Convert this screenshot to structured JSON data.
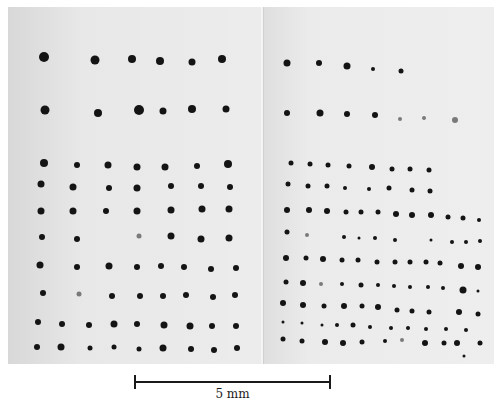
{
  "figure": {
    "scale_bar": {
      "label": "5 mm",
      "length_mm": 5
    },
    "panels": {
      "left": {
        "dots": [
          [
            44,
            57,
            5
          ],
          [
            95,
            60,
            4.5
          ],
          [
            132,
            59,
            4
          ],
          [
            160,
            61,
            4
          ],
          [
            192,
            62,
            3.5
          ],
          [
            222,
            59,
            4
          ],
          [
            45,
            110,
            4.5
          ],
          [
            98,
            113,
            4
          ],
          [
            139,
            110,
            5
          ],
          [
            163,
            111,
            3.5
          ],
          [
            192,
            109,
            4
          ],
          [
            226,
            109,
            3.5
          ],
          [
            44,
            163,
            4
          ],
          [
            77,
            165,
            3
          ],
          [
            108,
            165,
            3.5
          ],
          [
            137,
            167,
            3.5
          ],
          [
            165,
            167,
            3.5
          ],
          [
            197,
            166,
            3
          ],
          [
            228,
            164,
            4
          ],
          [
            41,
            184,
            3.5
          ],
          [
            73,
            187,
            3.5
          ],
          [
            109,
            188,
            3
          ],
          [
            137,
            188,
            3.5
          ],
          [
            171,
            186,
            3
          ],
          [
            201,
            186,
            3
          ],
          [
            230,
            187,
            3
          ],
          [
            41,
            211,
            3.5
          ],
          [
            73,
            211,
            3.5
          ],
          [
            106,
            211,
            3
          ],
          [
            137,
            211,
            3.5
          ],
          [
            171,
            210,
            3.5
          ],
          [
            202,
            209,
            3.5
          ],
          [
            229,
            209,
            3.5
          ],
          [
            42,
            237,
            3
          ],
          [
            77,
            239,
            3
          ],
          [
            139,
            236,
            2.5,
            "f"
          ],
          [
            171,
            236,
            3.5
          ],
          [
            201,
            239,
            3.5
          ],
          [
            229,
            238,
            3.5
          ],
          [
            40,
            265,
            3.5
          ],
          [
            77,
            267,
            3
          ],
          [
            109,
            266,
            3.5
          ],
          [
            137,
            267,
            3
          ],
          [
            161,
            266,
            3
          ],
          [
            184,
            267,
            3
          ],
          [
            211,
            269,
            3
          ],
          [
            236,
            268,
            3
          ],
          [
            43,
            293,
            3
          ],
          [
            79,
            294,
            2.5,
            "f"
          ],
          [
            112,
            296,
            3
          ],
          [
            140,
            296,
            3
          ],
          [
            163,
            296,
            3
          ],
          [
            186,
            295,
            3
          ],
          [
            213,
            297,
            3
          ],
          [
            235,
            295,
            3
          ],
          [
            38,
            322,
            3
          ],
          [
            62,
            324,
            3
          ],
          [
            89,
            325,
            3
          ],
          [
            114,
            324,
            3.5
          ],
          [
            137,
            324,
            3
          ],
          [
            164,
            325,
            3.5
          ],
          [
            190,
            326,
            3.5
          ],
          [
            212,
            326,
            3
          ],
          [
            236,
            326,
            3
          ],
          [
            37,
            347,
            3
          ],
          [
            61,
            347,
            3.5
          ],
          [
            90,
            348,
            2.5
          ],
          [
            114,
            347,
            2.5
          ],
          [
            139,
            349,
            2.5
          ],
          [
            163,
            348,
            3.5
          ],
          [
            191,
            349,
            3
          ],
          [
            214,
            350,
            3
          ],
          [
            237,
            348,
            3
          ]
        ]
      },
      "right": {
        "dots": [
          [
            287,
            63,
            3.5
          ],
          [
            319,
            63,
            3
          ],
          [
            347,
            66,
            3.5
          ],
          [
            373,
            69,
            2
          ],
          [
            401,
            71,
            2.5
          ],
          [
            287,
            113,
            3
          ],
          [
            320,
            113,
            3.5
          ],
          [
            347,
            114,
            3
          ],
          [
            375,
            115,
            3
          ],
          [
            400,
            119,
            2,
            "f"
          ],
          [
            424,
            118,
            2,
            "f"
          ],
          [
            455,
            120,
            3,
            "f"
          ],
          [
            291,
            163,
            2.5
          ],
          [
            310,
            164,
            2.5
          ],
          [
            328,
            165,
            2.5
          ],
          [
            349,
            166,
            2.5
          ],
          [
            372,
            167,
            3
          ],
          [
            392,
            169,
            2.5
          ],
          [
            410,
            169,
            2.5
          ],
          [
            429,
            170,
            2.5
          ],
          [
            288,
            184,
            2.5
          ],
          [
            308,
            186,
            2.5
          ],
          [
            327,
            186,
            2.5
          ],
          [
            345,
            188,
            2
          ],
          [
            369,
            189,
            2
          ],
          [
            389,
            188,
            2.5
          ],
          [
            412,
            190,
            2.5
          ],
          [
            430,
            191,
            2.5
          ],
          [
            287,
            210,
            3
          ],
          [
            309,
            210,
            3
          ],
          [
            327,
            211,
            3
          ],
          [
            346,
            212,
            2.5
          ],
          [
            361,
            212,
            2.5
          ],
          [
            378,
            212,
            2.5
          ],
          [
            396,
            214,
            3
          ],
          [
            412,
            215,
            3
          ],
          [
            431,
            215,
            3
          ],
          [
            448,
            217,
            2.5
          ],
          [
            463,
            218,
            2.5
          ],
          [
            479,
            220,
            2
          ],
          [
            287,
            232,
            2.5
          ],
          [
            307,
            235,
            2,
            "f"
          ],
          [
            344,
            237,
            2
          ],
          [
            359,
            238,
            1.5
          ],
          [
            375,
            238,
            2
          ],
          [
            395,
            240,
            2
          ],
          [
            431,
            240,
            1.5
          ],
          [
            452,
            242,
            2
          ],
          [
            466,
            242,
            2
          ],
          [
            480,
            241,
            2
          ],
          [
            286,
            258,
            3
          ],
          [
            306,
            258,
            2.5
          ],
          [
            323,
            259,
            3
          ],
          [
            342,
            260,
            2.5
          ],
          [
            358,
            260,
            2.5
          ],
          [
            377,
            262,
            2.5
          ],
          [
            395,
            262,
            2.5
          ],
          [
            410,
            262,
            2.5
          ],
          [
            426,
            262,
            2.5
          ],
          [
            440,
            263,
            2.5
          ],
          [
            461,
            266,
            3
          ],
          [
            478,
            267,
            3
          ],
          [
            286,
            282,
            2.5
          ],
          [
            303,
            283,
            3
          ],
          [
            321,
            284,
            2,
            "f"
          ],
          [
            342,
            284,
            2
          ],
          [
            361,
            285,
            2.5
          ],
          [
            378,
            285,
            2
          ],
          [
            394,
            286,
            2
          ],
          [
            410,
            287,
            2
          ],
          [
            428,
            287,
            2
          ],
          [
            443,
            288,
            2
          ],
          [
            463,
            290,
            3.5
          ],
          [
            478,
            291,
            1.5
          ],
          [
            283,
            303,
            3
          ],
          [
            303,
            305,
            3
          ],
          [
            324,
            306,
            2.5
          ],
          [
            344,
            306,
            3
          ],
          [
            362,
            306,
            2.5
          ],
          [
            378,
            307,
            3
          ],
          [
            397,
            310,
            2.5
          ],
          [
            412,
            311,
            2.5
          ],
          [
            429,
            312,
            2.5
          ],
          [
            459,
            312,
            3
          ],
          [
            478,
            314,
            2.5
          ],
          [
            283,
            322,
            1.5
          ],
          [
            302,
            323,
            1.5
          ],
          [
            322,
            325,
            1.5
          ],
          [
            337,
            325,
            2
          ],
          [
            353,
            325,
            2.5
          ],
          [
            370,
            327,
            2
          ],
          [
            391,
            328,
            2
          ],
          [
            408,
            328,
            2
          ],
          [
            426,
            329,
            2
          ],
          [
            446,
            329,
            2
          ],
          [
            466,
            330,
            2
          ],
          [
            283,
            339,
            2.5
          ],
          [
            302,
            341,
            2.5
          ],
          [
            325,
            342,
            3
          ],
          [
            343,
            343,
            3
          ],
          [
            362,
            342,
            2.5
          ],
          [
            385,
            341,
            2
          ],
          [
            402,
            340,
            2,
            "f"
          ],
          [
            425,
            343,
            3
          ],
          [
            444,
            343,
            2.5
          ],
          [
            457,
            343,
            3
          ],
          [
            480,
            343,
            2.5
          ],
          [
            464,
            356,
            1.5
          ]
        ]
      }
    }
  }
}
